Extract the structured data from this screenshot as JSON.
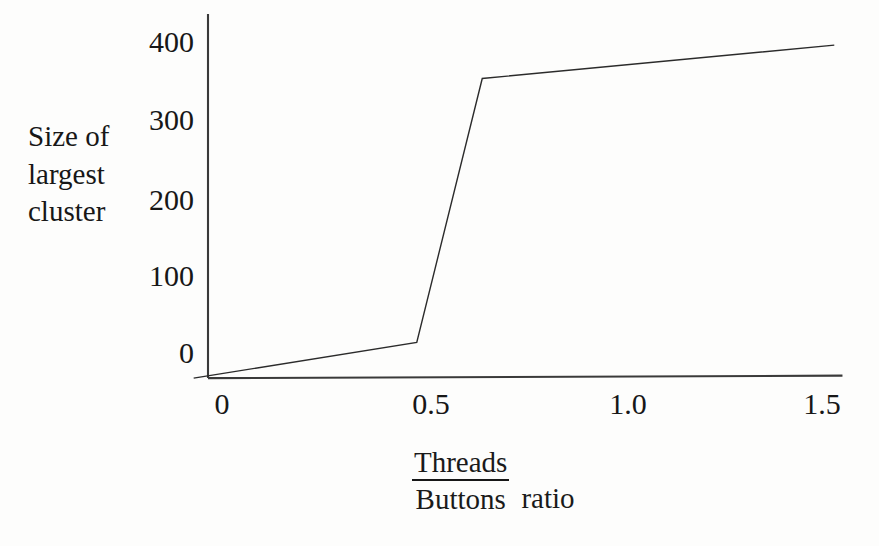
{
  "chart_data": {
    "type": "line",
    "title": "",
    "subtitle": "",
    "xlabel_numerator": "Threads",
    "xlabel_denominator": "Buttons",
    "xlabel_suffix": "ratio",
    "ylabel_lines": [
      "Size of",
      "largest",
      "cluster"
    ],
    "xlabel_full": "Threads/Buttons ratio",
    "ylabel_full": "Size of largest cluster",
    "xticks": [
      0,
      0.5,
      1.0,
      1.5
    ],
    "xtick_labels": [
      "0",
      "0.5",
      "1.0",
      "1.5"
    ],
    "yticks": [
      0,
      100,
      200,
      300,
      400
    ],
    "ytick_labels": [
      "0",
      "100",
      "200",
      "300",
      "400"
    ],
    "xlim": [
      -0.04,
      1.55
    ],
    "ylim": [
      -35,
      410
    ],
    "grid": false,
    "legend": null,
    "series": [
      {
        "name": "largest cluster size",
        "x": [
          -0.035,
          0.51,
          0.67,
          1.53
        ],
        "y": [
          -33,
          13,
          353,
          396
        ],
        "color": "#2b2b2b",
        "linewidth": 1.4
      }
    ],
    "annotations": [],
    "axes": {
      "x_axis_color": "#3a3a3a",
      "y_axis_color": "#3a3a3a",
      "spines": [
        "left",
        "bottom"
      ],
      "ticks_drawn": false
    }
  },
  "figure": {
    "background_color": "#fdfdfc",
    "ink_color": "#171717"
  }
}
